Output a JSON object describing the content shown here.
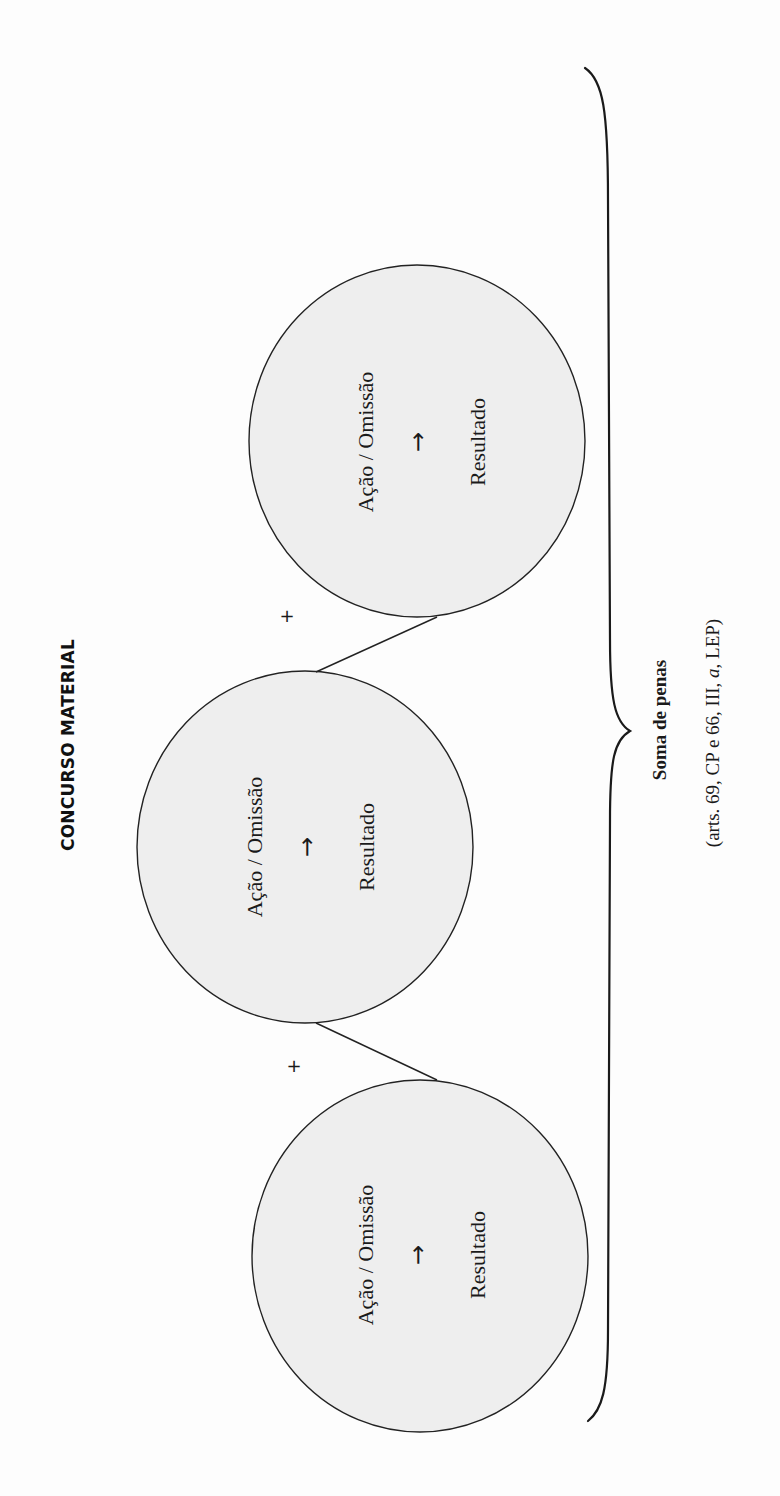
{
  "title": "CONCURSO MATERIAL",
  "circles": [
    {
      "action": "Ação / Omissão",
      "arrow": "→",
      "result": "Resultado"
    },
    {
      "action": "Ação / Omissão",
      "arrow": "→",
      "result": "Resultado"
    },
    {
      "action": "Ação / Omissão",
      "arrow": "→",
      "result": "Resultado"
    }
  ],
  "connectors": {
    "plus_1": "+",
    "plus_2": "+"
  },
  "summary": {
    "label": "Soma de penas",
    "citation_prefix": "(arts. 69, CP e 66, III, ",
    "citation_italic": "a",
    "citation_suffix": ", LEP)"
  },
  "colors": {
    "circle_fill": "#eeeeee",
    "stroke": "#222222",
    "background": "#fdfdfd"
  }
}
